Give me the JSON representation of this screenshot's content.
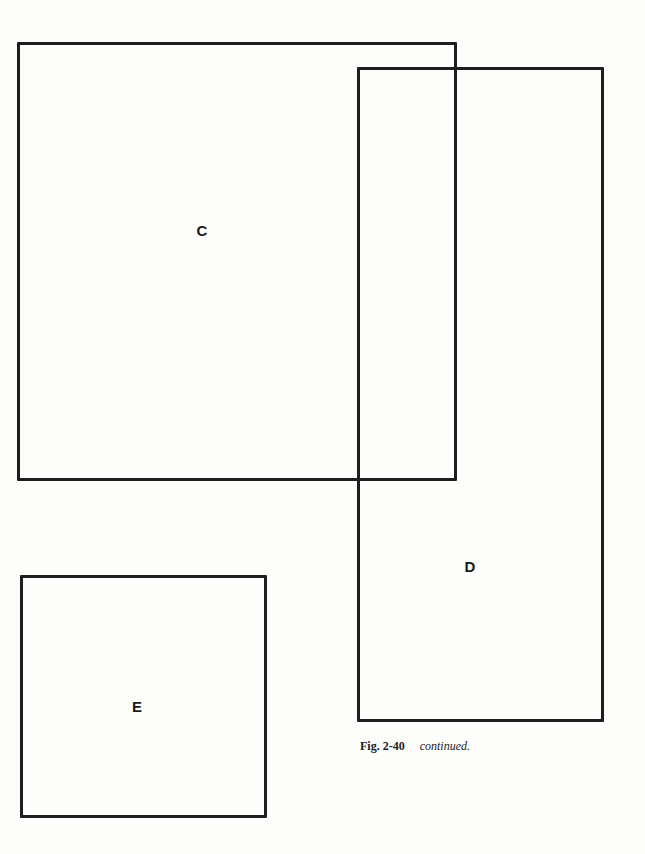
{
  "figure": {
    "boxes": [
      {
        "id": "C",
        "label": "C"
      },
      {
        "id": "D",
        "label": "D"
      },
      {
        "id": "E",
        "label": "E"
      }
    ],
    "caption": {
      "figure_number": "Fig. 2-40",
      "text": "continued."
    }
  }
}
